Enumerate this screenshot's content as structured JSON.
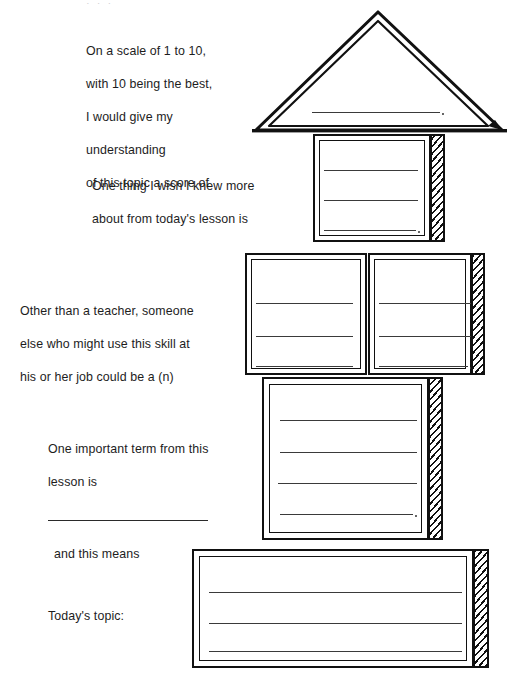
{
  "worksheet": {
    "title": "Exit Ticket House Graphic Organizer",
    "page_background": "#ffffff",
    "ink_color": "#111111",
    "line_color": "#3a3a3a"
  },
  "top_sliver": {
    "text": "· · ·"
  },
  "sections": [
    {
      "id": "roof",
      "shape": "triangle",
      "prompt_lines": [
        "On a scale of 1 to 10,",
        "with 10 being the best,",
        "I would give my",
        "understanding",
        "of this topic a score of"
      ],
      "write_lines": 1,
      "has_period_mark": true
    },
    {
      "id": "tier-2",
      "shape": "box",
      "prompt_lines": [
        "One thing I wish I knew more",
        "about from today's lesson is"
      ],
      "write_lines": 3,
      "has_period_mark": true,
      "has_hatched_side": true
    },
    {
      "id": "tier-3",
      "shape": "double-box",
      "prompt_lines": [
        "Other than a teacher, someone",
        "else who might use this skill at",
        "his or her job could be a (n)"
      ],
      "write_lines_left": 3,
      "write_lines_right": 3,
      "has_period_mark": true,
      "has_hatched_side": true
    },
    {
      "id": "tier-4",
      "shape": "box",
      "prompt_lines_top": [
        "One important term from this",
        "lesson is"
      ],
      "prompt_rule": true,
      "prompt_lines_bottom": [
        "and this means"
      ],
      "write_lines": 4,
      "has_period_mark": true,
      "has_hatched_side": true
    },
    {
      "id": "tier-5",
      "shape": "wide-box",
      "prompt_lines": [
        "Today's topic:"
      ],
      "write_lines": 3,
      "has_period_mark": false,
      "has_hatched_side": true
    }
  ]
}
